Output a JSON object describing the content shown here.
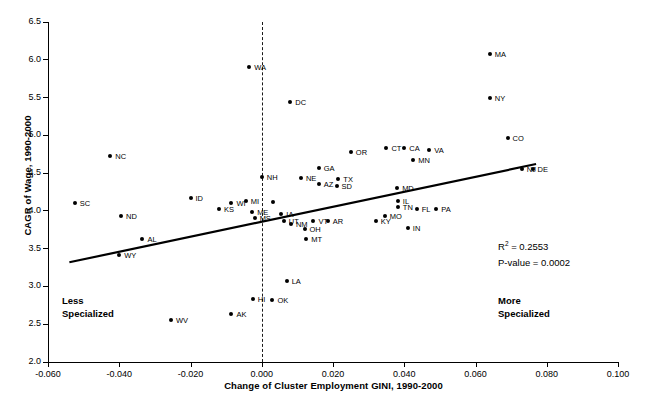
{
  "chart_data": {
    "type": "scatter",
    "title": "",
    "xlabel": "Change of Cluster Employment GINI, 1990-2000",
    "ylabel": "CAGR of Wage, 1990-2000",
    "xlim": [
      -0.06,
      0.1
    ],
    "ylim": [
      2.0,
      6.5
    ],
    "xticks": [
      "-0.060",
      "-0.040",
      "-0.020",
      "0.000",
      "0.020",
      "0.040",
      "0.060",
      "0.080",
      "0.100"
    ],
    "xtick_values": [
      -0.06,
      -0.04,
      -0.02,
      0.0,
      0.02,
      0.04,
      0.06,
      0.08,
      0.1
    ],
    "yticks": [
      "6.5",
      "6.0",
      "5.5",
      "5.0",
      "4.5",
      "4.0",
      "3.5",
      "3.0",
      "2.5",
      "2.0"
    ],
    "ytick_values": [
      6.5,
      6.0,
      5.5,
      5.0,
      4.5,
      4.0,
      3.5,
      3.0,
      2.5,
      2.0
    ],
    "grid": false,
    "legend": "none",
    "reference_line": {
      "orientation": "vertical",
      "x": 0.0,
      "style": "dashed"
    },
    "trend_line": {
      "x0": -0.054,
      "y0": 3.32,
      "x1": 0.077,
      "y1": 4.62,
      "style": "solid"
    },
    "annotations": [
      {
        "name": "r-squared",
        "text": "R² = 0.2553",
        "value": 0.2553
      },
      {
        "name": "p-value",
        "text": "P-value = 0.0002",
        "value": 0.0002
      },
      {
        "name": "less-specialized",
        "text": "Less\nSpecialized"
      },
      {
        "name": "more-specialized",
        "text": "More\nSpecialized"
      }
    ],
    "points": [
      {
        "label": "SC",
        "x": -0.0525,
        "y": 4.1,
        "lpos": "right"
      },
      {
        "label": "NC",
        "x": -0.0425,
        "y": 4.73,
        "lpos": "right"
      },
      {
        "label": "ND",
        "x": -0.0395,
        "y": 3.93,
        "lpos": "right"
      },
      {
        "label": "WY",
        "x": -0.04,
        "y": 3.41,
        "lpos": "right"
      },
      {
        "label": "AL",
        "x": -0.0335,
        "y": 3.63,
        "lpos": "right"
      },
      {
        "label": "WV",
        "x": -0.0255,
        "y": 2.55,
        "lpos": "right"
      },
      {
        "label": "ID",
        "x": -0.02,
        "y": 4.17,
        "lpos": "right"
      },
      {
        "label": "KS",
        "x": -0.012,
        "y": 4.02,
        "lpos": "right"
      },
      {
        "label": "WI",
        "x": -0.0085,
        "y": 4.1,
        "lpos": "right"
      },
      {
        "label": "AK",
        "x": -0.0085,
        "y": 2.63,
        "lpos": "right"
      },
      {
        "label": "MI",
        "x": -0.0045,
        "y": 4.13,
        "lpos": "right"
      },
      {
        "label": "WA",
        "x": -0.0035,
        "y": 5.91,
        "lpos": "right"
      },
      {
        "label": "ME",
        "x": -0.0027,
        "y": 3.99,
        "lpos": "right"
      },
      {
        "label": "MS",
        "x": -0.002,
        "y": 3.91,
        "lpos": "right"
      },
      {
        "label": "HI",
        "x": -0.0025,
        "y": 2.83,
        "lpos": "right"
      },
      {
        "label": "NH",
        "x": 0.0,
        "y": 4.45,
        "lpos": "right"
      },
      {
        "label": "OK",
        "x": 0.003,
        "y": 2.82,
        "lpos": "right"
      },
      {
        "label": "NJ2",
        "x": 0.0032,
        "y": 4.12,
        "lpos": "none"
      },
      {
        "label": "IA",
        "x": 0.0055,
        "y": 3.96,
        "lpos": "right"
      },
      {
        "label": "UT",
        "x": 0.0062,
        "y": 3.86,
        "lpos": "right"
      },
      {
        "label": "NM",
        "x": 0.0082,
        "y": 3.82,
        "lpos": "right"
      },
      {
        "label": "LA",
        "x": 0.007,
        "y": 3.07,
        "lpos": "right"
      },
      {
        "label": "DC",
        "x": 0.008,
        "y": 5.44,
        "lpos": "right"
      },
      {
        "label": "NE",
        "x": 0.011,
        "y": 4.43,
        "lpos": "right"
      },
      {
        "label": "MT",
        "x": 0.0125,
        "y": 3.63,
        "lpos": "right"
      },
      {
        "label": "OH",
        "x": 0.012,
        "y": 3.76,
        "lpos": "right"
      },
      {
        "label": "VT",
        "x": 0.0145,
        "y": 3.87,
        "lpos": "right"
      },
      {
        "label": "GA",
        "x": 0.016,
        "y": 4.57,
        "lpos": "right"
      },
      {
        "label": "AZ",
        "x": 0.016,
        "y": 4.36,
        "lpos": "right"
      },
      {
        "label": "AR",
        "x": 0.0185,
        "y": 3.86,
        "lpos": "right"
      },
      {
        "label": "SD",
        "x": 0.021,
        "y": 4.33,
        "lpos": "right"
      },
      {
        "label": "TX",
        "x": 0.0215,
        "y": 4.42,
        "lpos": "right"
      },
      {
        "label": "OR",
        "x": 0.025,
        "y": 4.78,
        "lpos": "right"
      },
      {
        "label": "KY",
        "x": 0.032,
        "y": 3.86,
        "lpos": "right"
      },
      {
        "label": "MO",
        "x": 0.0345,
        "y": 3.93,
        "lpos": "right"
      },
      {
        "label": "CT",
        "x": 0.035,
        "y": 4.83,
        "lpos": "right"
      },
      {
        "label": "MD",
        "x": 0.038,
        "y": 4.3,
        "lpos": "right"
      },
      {
        "label": "IL",
        "x": 0.0382,
        "y": 4.13,
        "lpos": "right"
      },
      {
        "label": "CA",
        "x": 0.04,
        "y": 4.83,
        "lpos": "right"
      },
      {
        "label": "TN",
        "x": 0.0382,
        "y": 4.05,
        "lpos": "right"
      },
      {
        "label": "IN",
        "x": 0.041,
        "y": 3.78,
        "lpos": "right"
      },
      {
        "label": "MN",
        "x": 0.0425,
        "y": 4.67,
        "lpos": "right"
      },
      {
        "label": "FL",
        "x": 0.0435,
        "y": 4.02,
        "lpos": "right"
      },
      {
        "label": "VA",
        "x": 0.047,
        "y": 4.8,
        "lpos": "right"
      },
      {
        "label": "PA",
        "x": 0.049,
        "y": 4.03,
        "lpos": "right"
      },
      {
        "label": "MA",
        "x": 0.064,
        "y": 6.08,
        "lpos": "right"
      },
      {
        "label": "NY",
        "x": 0.064,
        "y": 5.5,
        "lpos": "right"
      },
      {
        "label": "CO",
        "x": 0.069,
        "y": 4.97,
        "lpos": "right"
      },
      {
        "label": "NJ",
        "x": 0.073,
        "y": 4.56,
        "lpos": "right"
      },
      {
        "label": "DE",
        "x": 0.076,
        "y": 4.55,
        "lpos": "right"
      }
    ]
  }
}
